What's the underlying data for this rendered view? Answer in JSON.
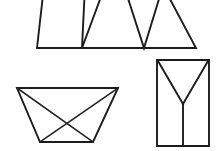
{
  "canvas": {
    "width": 223,
    "height": 151,
    "background": "#ffffff",
    "ink_color": "#1c1c1c",
    "description": "Three black-and-white line-drawing geometric figures on a plain white field"
  },
  "figures": [
    {
      "id": "zigzag-band",
      "name": "sawtooth-band",
      "label": "Zigzag band with two V notches",
      "position": "top",
      "cropped": "apexes cut off by top edge of image",
      "baseline_y": 48,
      "paths": [
        {
          "name": "zigzag-outline",
          "d": "M 37 48 L 196 48 L 163 -14 M 37 48 L 44 -14 M 85 -14 L 82 48 L 105 -14 M 124 -14 L 144 48 L 163 -14"
        }
      ]
    },
    {
      "id": "trapezoid-with-diagonals",
      "name": "inverted-trapezoid",
      "label": "Inverted trapezoid with crossed diagonals",
      "position": "bottom-left",
      "corners": {
        "top_left": [
          17,
          88
        ],
        "top_right": [
          118,
          88
        ],
        "bottom_right": [
          93,
          142
        ],
        "bottom_left": [
          40,
          142
        ]
      },
      "paths": [
        {
          "name": "trapezoid-outline",
          "d": "M 17 88 L 118 88 L 93 142 L 40 142 Z"
        },
        {
          "name": "diagonal-top-left-to-bottom-right",
          "d": "M 17 88 L 93 142"
        },
        {
          "name": "diagonal-top-right-to-bottom-left",
          "d": "M 118 88 L 40 142"
        }
      ]
    },
    {
      "id": "rectangle-with-y",
      "name": "rectangle-with-y-shape",
      "label": "Rectangle containing a Y figure",
      "position": "bottom-right",
      "corners": {
        "top_left": [
          157,
          60
        ],
        "top_right": [
          209,
          60
        ],
        "bottom_right": [
          209,
          146
        ],
        "bottom_left": [
          157,
          146
        ]
      },
      "junction_point": [
        183,
        104
      ],
      "paths": [
        {
          "name": "rectangle-outline",
          "d": "M 157 60 L 209 60 L 209 146 L 157 146 Z"
        },
        {
          "name": "y-left-arm",
          "d": "M 158 61 L 183 104"
        },
        {
          "name": "y-right-arm",
          "d": "M 208 61 L 183 104"
        },
        {
          "name": "y-stem",
          "d": "M 183 104 L 183 146"
        }
      ]
    }
  ]
}
